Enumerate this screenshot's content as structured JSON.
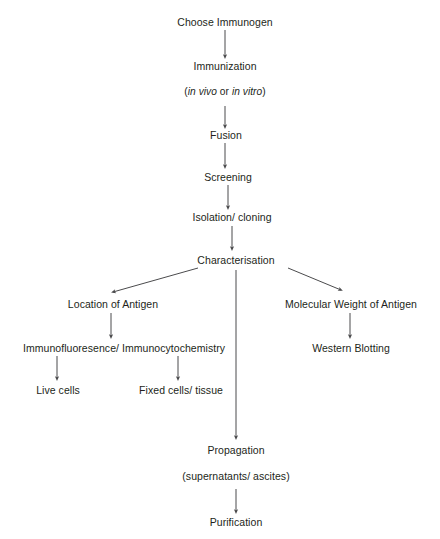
{
  "diagram": {
    "background_color": "#ffffff",
    "text_color": "#231f20",
    "line_color": "#4b4b4d",
    "nodes": {
      "choose_immunogen": "Choose Immunogen",
      "immunization": "Immunization",
      "immunization_note_open": "(",
      "immunization_note_italic_1": "in vivo",
      "immunization_note_mid": " or ",
      "immunization_note_italic_2": "in vitro",
      "immunization_note_close": ")",
      "fusion": "Fusion",
      "screening": "Screening",
      "isolation_cloning": "Isolation/ cloning",
      "characterisation": "Characterisation",
      "location_of_antigen": "Location of Antigen",
      "molecular_weight_of_antigen": "Molecular Weight of Antigen",
      "immunofluoresence": "Immunofluoresence/ Immunocytochemistry",
      "western_blotting": "Western Blotting",
      "live_cells": "Live cells",
      "fixed_cells_tissue": "Fixed cells/ tissue",
      "propagation": "Propagation",
      "propagation_note": "(supernatants/ ascites)",
      "purification": "Purification"
    },
    "edges": [
      {
        "name": "choose-immunogen-to-immunization",
        "from": "choose_immunogen",
        "to": "immunization"
      },
      {
        "name": "immunization-to-fusion",
        "from": "immunization",
        "to": "fusion"
      },
      {
        "name": "fusion-to-screening",
        "from": "fusion",
        "to": "screening"
      },
      {
        "name": "screening-to-isolation",
        "from": "screening",
        "to": "isolation_cloning"
      },
      {
        "name": "isolation-to-characterisation",
        "from": "isolation_cloning",
        "to": "characterisation"
      },
      {
        "name": "characterisation-to-location",
        "from": "characterisation",
        "to": "location_of_antigen"
      },
      {
        "name": "characterisation-to-molecular-weight",
        "from": "characterisation",
        "to": "molecular_weight_of_antigen"
      },
      {
        "name": "characterisation-to-propagation",
        "from": "characterisation",
        "to": "propagation"
      },
      {
        "name": "location-to-immunofluoresence",
        "from": "location_of_antigen",
        "to": "immunofluoresence"
      },
      {
        "name": "molecular-weight-to-western-blotting",
        "from": "molecular_weight_of_antigen",
        "to": "western_blotting"
      },
      {
        "name": "immunofluoresence-to-live-cells",
        "from": "immunofluoresence",
        "to": "live_cells"
      },
      {
        "name": "immunofluoresence-to-fixed-cells",
        "from": "immunofluoresence",
        "to": "fixed_cells_tissue"
      },
      {
        "name": "propagation-to-purification",
        "from": "propagation",
        "to": "purification"
      }
    ]
  }
}
